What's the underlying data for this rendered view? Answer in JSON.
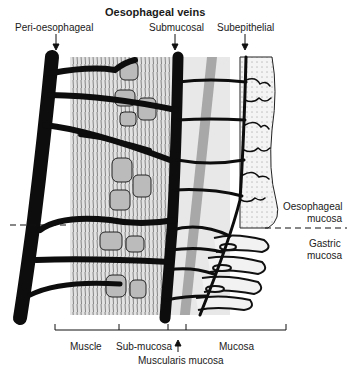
{
  "title": "Oesophageal veins",
  "vein_labels": {
    "peri": "Peri-oesophageal",
    "submucosal": "Submucosal",
    "subepithelial": "Subepithelial"
  },
  "region_labels": {
    "oesophageal_1": "Oesophageal",
    "oesophageal_2": "mucosa",
    "gastric_1": "Gastric",
    "gastric_2": "mucosa"
  },
  "layer_labels": {
    "muscle": "Muscle",
    "submucosa": "Sub-mucosa",
    "muscularis": "Muscularis mucosa",
    "mucosa": "Mucosa"
  },
  "colors": {
    "vein": "#0d0d0d",
    "tissue": "#e6e6e6",
    "tissue_dark": "#bdbdbd",
    "background": "#ffffff"
  }
}
